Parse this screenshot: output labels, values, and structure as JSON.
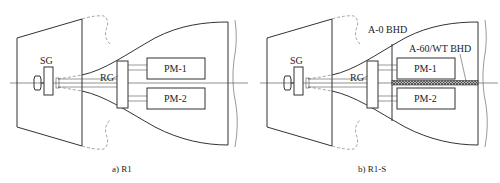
{
  "panels": [
    {
      "id": "a",
      "caption": "a) R1",
      "labels": {
        "sg": "SG",
        "rg": "RG",
        "pm1": "PM-1",
        "pm2": "PM-2"
      }
    },
    {
      "id": "b",
      "caption": "b) R1-S",
      "labels": {
        "sg": "SG",
        "rg": "RG",
        "pm1": "PM-1",
        "pm2": "PM-2",
        "bhd_a0": "A-0 BHD",
        "bhd_a60": "A-60/WT BHD"
      }
    }
  ],
  "colors": {
    "line": "#333333",
    "background": "#ffffff"
  }
}
